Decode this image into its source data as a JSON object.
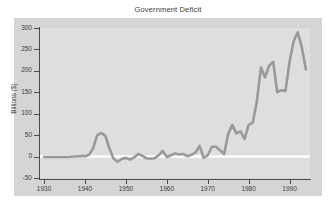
{
  "figure": {
    "background_color": "#ffffff",
    "panel_color": "#d5d5d5",
    "plot_background_color": "#dedede",
    "axis_color": "#4a4a4a",
    "line_color": "#999999",
    "zero_line_color": "#ffffff"
  },
  "chart_data": {
    "type": "line",
    "title": "Government Deficit",
    "xlabel": "",
    "ylabel": "Billions ($)",
    "xlim": [
      1929,
      1995
    ],
    "ylim": [
      -50,
      300
    ],
    "xticks": [
      1930,
      1940,
      1950,
      1960,
      1970,
      1980,
      1990
    ],
    "xtick_labels": [
      "1930",
      "1940",
      "1950",
      "1960",
      "1970",
      "1980",
      "1990"
    ],
    "yticks": [
      -50,
      0,
      50,
      100,
      150,
      200,
      250,
      300
    ],
    "ytick_labels": [
      "-50",
      "0",
      "50",
      "100",
      "150",
      "200",
      "250",
      "300"
    ],
    "grid": false,
    "legend": false,
    "zero_reference_line": 0,
    "series": [
      {
        "name": "Government Deficit",
        "color": "#999999",
        "x": [
          1930,
          1931,
          1932,
          1933,
          1934,
          1935,
          1936,
          1937,
          1938,
          1939,
          1940,
          1941,
          1942,
          1943,
          1944,
          1945,
          1946,
          1947,
          1948,
          1949,
          1950,
          1951,
          1952,
          1953,
          1954,
          1955,
          1956,
          1957,
          1958,
          1959,
          1960,
          1961,
          1962,
          1963,
          1964,
          1965,
          1966,
          1967,
          1968,
          1969,
          1970,
          1971,
          1972,
          1973,
          1974,
          1975,
          1976,
          1977,
          1978,
          1979,
          1980,
          1981,
          1982,
          1983,
          1984,
          1985,
          1986,
          1987,
          1988,
          1989,
          1990,
          1991,
          1992,
          1993,
          1994
        ],
        "y": [
          -1,
          -1,
          -1,
          -1,
          -1,
          -1,
          -1,
          0,
          0,
          1,
          1,
          4,
          20,
          50,
          55,
          48,
          18,
          -5,
          -12,
          -5,
          -3,
          -7,
          -2,
          6,
          2,
          -4,
          -5,
          -4,
          3,
          13,
          -1,
          3,
          7,
          5,
          6,
          1,
          4,
          9,
          25,
          -3,
          3,
          23,
          23,
          15,
          6,
          53,
          74,
          54,
          59,
          41,
          74,
          79,
          128,
          208,
          185,
          212,
          221,
          150,
          155,
          153,
          221,
          269,
          290,
          255,
          203
        ]
      }
    ]
  }
}
